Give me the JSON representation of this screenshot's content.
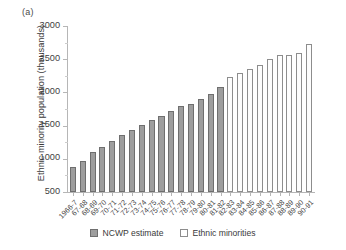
{
  "panel": {
    "label": "(a)"
  },
  "legend": {
    "position": "bottom-center",
    "entries": [
      {
        "name": "ncwp-estimate",
        "label": "NCWP estimate",
        "color": "#9e9e9e"
      },
      {
        "name": "ethnic-minorities",
        "label": "Ethnic minorities",
        "color": "#ffffff"
      }
    ]
  },
  "chart_data": {
    "type": "bar",
    "title": "",
    "subtitle": "",
    "xlabel": "",
    "ylabel": "Ethnic minority population (thousands)",
    "ylim": [
      500,
      3000
    ],
    "yticks": [
      500,
      1000,
      1500,
      2000,
      2500,
      3000
    ],
    "ytick_labels": [
      "500",
      "1000",
      "1500",
      "2000",
      "2500",
      "3000"
    ],
    "grid": false,
    "legend_position": "bottom-center",
    "categories": [
      "1966-7",
      "67-68",
      "68-69",
      "69-70",
      "70-71",
      "71-72",
      "72-73",
      "73-74",
      "74-75",
      "75-76",
      "76-77",
      "77-78",
      "78-79",
      "79-80",
      "80-81",
      "81-82",
      "82-83",
      "83-84",
      "84-85",
      "85-86",
      "86-87",
      "87-88",
      "88-89",
      "89-90",
      "90-91"
    ],
    "series": [
      {
        "name": "NCWP estimate",
        "color": "#9e9e9e",
        "values": [
          880,
          960,
          1100,
          1180,
          1270,
          1360,
          1430,
          1510,
          1580,
          1650,
          1720,
          1790,
          1830,
          1900,
          1970,
          2080,
          null,
          null,
          null,
          null,
          null,
          null,
          null,
          null,
          null
        ]
      },
      {
        "name": "Ethnic minorities",
        "color": "#ffffff",
        "values": [
          null,
          null,
          null,
          null,
          null,
          null,
          null,
          null,
          null,
          null,
          null,
          null,
          null,
          null,
          null,
          null,
          2230,
          2290,
          2350,
          2410,
          2500,
          2560,
          2560,
          2600,
          2730
        ]
      }
    ]
  }
}
